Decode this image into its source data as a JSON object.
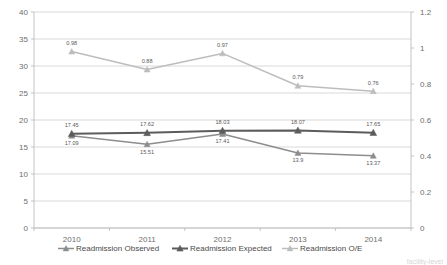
{
  "chart_data": {
    "type": "line",
    "title": "",
    "xlabel": "",
    "ylabel": "",
    "categories": [
      "2010",
      "2011",
      "2012",
      "2013",
      "2014"
    ],
    "grid": true,
    "legend_position": "bottom",
    "axes": {
      "left": {
        "min": 0,
        "max": 40,
        "step": 5,
        "ticks": [
          "0",
          "5",
          "10",
          "15",
          "20",
          "25",
          "30",
          "35",
          "40"
        ]
      },
      "right": {
        "min": 0,
        "max": 1.2,
        "step": 0.2,
        "ticks": [
          "0",
          "0.2",
          "0.4",
          "0.6",
          "0.8",
          "1",
          "1.2"
        ]
      }
    },
    "series": [
      {
        "name": "Readmission Observed",
        "axis": "left",
        "color": "#8d8d8d",
        "marker": "triangle",
        "values": [
          17.09,
          15.51,
          17.41,
          13.9,
          13.37
        ],
        "labels": [
          "17.09",
          "15.51",
          "17.41",
          "13.9",
          "13.37"
        ],
        "label_pos": [
          "below",
          "below",
          "below",
          "below",
          "below"
        ]
      },
      {
        "name": "Readmission Expected",
        "axis": "left",
        "color": "#5c5c5c",
        "marker": "triangle",
        "values": [
          17.45,
          17.62,
          18.03,
          18.07,
          17.65
        ],
        "labels": [
          "17.45",
          "17.62",
          "18.03",
          "18.07",
          "17.65"
        ],
        "label_pos": [
          "above",
          "above",
          "above",
          "above",
          "above"
        ]
      },
      {
        "name": "Readmission O/E",
        "axis": "right",
        "color": "#bdbdbd",
        "marker": "triangle",
        "values": [
          0.98,
          0.88,
          0.97,
          0.79,
          0.76
        ],
        "labels": [
          "0.98",
          "0.88",
          "0.97",
          "0.79",
          "0.76"
        ],
        "label_pos": [
          "above",
          "above",
          "above",
          "above",
          "above"
        ]
      }
    ]
  },
  "legend": {
    "items": [
      {
        "label": "Readmission Observed",
        "color": "#8d8d8d"
      },
      {
        "label": "Readmission Expected",
        "color": "#5c5c5c"
      },
      {
        "label": "Readmission O/E",
        "color": "#bdbdbd"
      }
    ]
  },
  "footer": {
    "cut_text": "facility-level"
  }
}
